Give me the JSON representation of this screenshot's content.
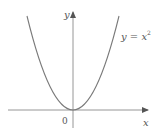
{
  "figure": {
    "type": "function-graph",
    "function": "y = x^2",
    "labels": {
      "y_axis": "y",
      "x_axis": "x",
      "origin": "0",
      "curve_lhs": "y = x",
      "curve_exp": "2"
    },
    "colors": {
      "curve": "#7a7a7a",
      "axes": "#8a8a8a",
      "text": "#555555"
    }
  }
}
